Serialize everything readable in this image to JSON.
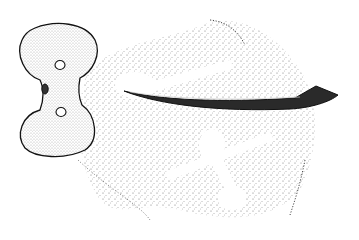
{
  "image": {
    "description": "Stippled line illustration of archaeological artifacts: a double-lobed stone axe/hammer with holes and a curved bone hook, over a dotted ground area showing imprint outlines",
    "background": "#ffffff",
    "ink": "#1a1a1a",
    "objects": [
      {
        "name": "double-lobed-stone",
        "position": "left"
      },
      {
        "name": "curved-hook",
        "position": "center-right"
      },
      {
        "name": "imprint-outlines",
        "position": "center"
      }
    ]
  }
}
